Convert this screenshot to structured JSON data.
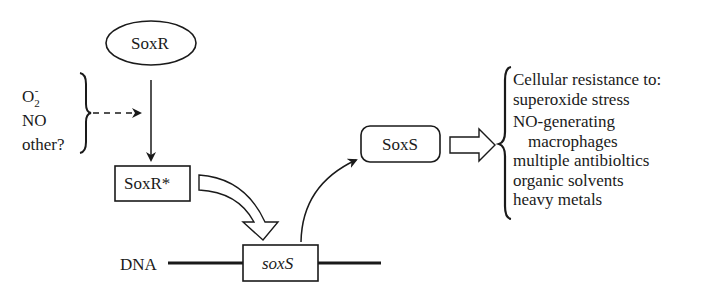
{
  "diagram": {
    "nodes": {
      "soxr": "SoxR",
      "soxr_active": "SoxR*",
      "soxs_gene": "soxS",
      "soxs_protein": "SoxS",
      "dna_label": "DNA"
    },
    "stimuli": {
      "superoxide": {
        "base": "O",
        "sub": "2",
        "sup": "-"
      },
      "nitric_oxide": "NO",
      "other": "other?"
    },
    "effects": {
      "heading": "Cellular resistance to:",
      "items": [
        "superoxide stress",
        "NO-generating",
        "macrophages",
        "multiple antibioltics",
        "organic solvents",
        "heavy metals"
      ]
    },
    "colors": {
      "ink": "#1a1a1a",
      "background": "#ffffff"
    }
  }
}
